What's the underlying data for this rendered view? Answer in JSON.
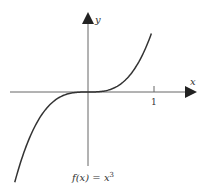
{
  "chart_data": {
    "type": "line",
    "title": "",
    "caption": "f(x) = x³",
    "xlabel": "x",
    "ylabel": "y",
    "x_ticks": [
      {
        "value": 1,
        "label": "1"
      }
    ],
    "y_ticks": [],
    "grid": false,
    "legend": null,
    "series": [
      {
        "name": "f(x) = x^3",
        "function": "x^3",
        "x": [
          -1.1,
          -1.0,
          -0.8,
          -0.6,
          -0.4,
          -0.2,
          0,
          0.2,
          0.4,
          0.6,
          0.8,
          1.0
        ],
        "y": [
          -1.331,
          -1.0,
          -0.512,
          -0.216,
          -0.064,
          -0.008,
          0,
          0.008,
          0.064,
          0.216,
          0.512,
          1.0
        ]
      }
    ],
    "xlim": [
      -1.2,
      1.6
    ],
    "ylim": [
      -1.2,
      1.2
    ]
  },
  "labels": {
    "x_axis": "x",
    "y_axis": "y",
    "tick_1": "1",
    "caption_prefix": "f(x) = x",
    "caption_exp": "3"
  },
  "colors": {
    "curve": "#333333",
    "axis": "#555555"
  }
}
